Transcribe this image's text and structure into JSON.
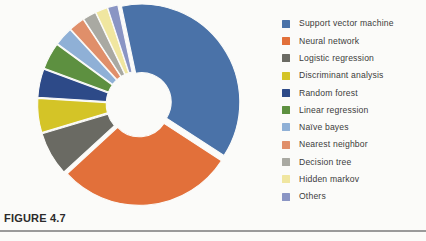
{
  "figure": {
    "caption": "FIGURE 4.7"
  },
  "chart_data": {
    "type": "pie",
    "variant": "exploded-doughnut",
    "title": "",
    "subtitle": "",
    "xlabel": "",
    "ylabel": "",
    "grid": false,
    "legend_position": "right",
    "inner_radius_ratio": 0.3,
    "start_angle_deg": -12,
    "labels": [
      "Support vector machine",
      "Neural network",
      "Logistic regression",
      "Discriminant analysis",
      "Random forest",
      "Linear regression",
      "Naïve bayes",
      "Nearest neighbor",
      "Decision tree",
      "Hidden markov",
      "Others"
    ],
    "values": [
      37.5,
      29.0,
      7.2,
      5.6,
      4.7,
      4.4,
      3.1,
      2.6,
      2.2,
      2.0,
      1.7
    ],
    "colors": [
      "#4a72a8",
      "#e2703a",
      "#6a6a63",
      "#d4c427",
      "#2d4a88",
      "#5d9040",
      "#8fb0d6",
      "#e08f6a",
      "#a9a9a2",
      "#f0e6a0",
      "#8a95c4"
    ],
    "annotations": []
  },
  "legend": {
    "items": [
      {
        "label": "Support vector machine",
        "color": "#4a72a8"
      },
      {
        "label": "Neural network",
        "color": "#e2703a"
      },
      {
        "label": "Logistic  regression",
        "color": "#6a6a63"
      },
      {
        "label": "Discriminant analysis",
        "color": "#d4c427"
      },
      {
        "label": "Random forest",
        "color": "#2d4a88"
      },
      {
        "label": "Linear regression",
        "color": "#5d9040"
      },
      {
        "label": "Naïve bayes",
        "color": "#8fb0d6"
      },
      {
        "label": "Nearest  neighbor",
        "color": "#e08f6a"
      },
      {
        "label": "Decision tree",
        "color": "#a9a9a2"
      },
      {
        "label": "Hidden markov",
        "color": "#f0e6a0"
      },
      {
        "label": "Others",
        "color": "#8a95c4"
      }
    ]
  }
}
